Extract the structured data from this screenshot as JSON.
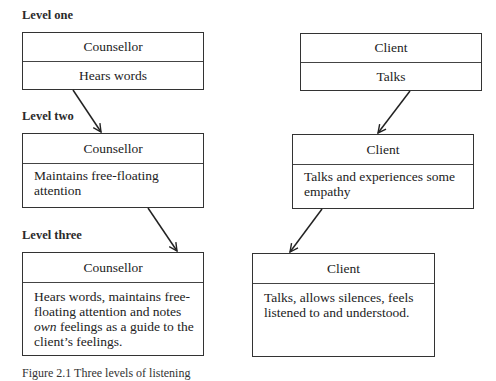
{
  "levels": [
    {
      "label": "Level one",
      "counsellor": {
        "title": "Counsellor",
        "body": "Hears words"
      },
      "client": {
        "title": "Client",
        "body": "Talks"
      }
    },
    {
      "label": "Level two",
      "counsellor": {
        "title": "Counsellor",
        "body": "Maintains free-floating attention"
      },
      "client": {
        "title": "Client",
        "body": "Talks and experiences some empathy"
      }
    },
    {
      "label": "Level three",
      "counsellor": {
        "title": "Counsellor",
        "body_before": "Hears words, maintains free-floating attention and notes ",
        "body_emph": "own",
        "body_after": " feelings as a guide to the client’s feelings."
      },
      "client": {
        "title": "Client",
        "body": "Talks, allows silences, feels listened to and understood."
      }
    }
  ],
  "caption": "Figure 2.1  Three levels of listening",
  "colors": {
    "line": "#333333",
    "text": "#222222",
    "background": "#ffffff"
  }
}
